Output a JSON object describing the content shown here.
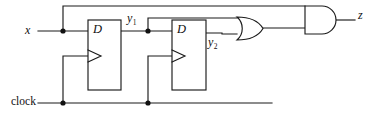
{
  "diagram": {
    "type": "logic-circuit-schematic",
    "background_color": "#ffffff",
    "line_color": "#1a1a1a"
  },
  "labels": {
    "input_x": "x",
    "input_clock": "clock",
    "signal_y1_base": "y",
    "signal_y1_sub": "1",
    "signal_y2_base": "y",
    "signal_y2_sub": "2",
    "output_z": "z",
    "flipflop1_d": "D",
    "flipflop2_d": "D"
  },
  "components": [
    {
      "id": "flipflop-1",
      "kind": "d-flip-flop",
      "label": "D",
      "inputs": [
        "x",
        "clock"
      ],
      "outputs": [
        "y1"
      ],
      "box": {
        "x": 88,
        "y": 20,
        "width": 33,
        "height": 70
      }
    },
    {
      "id": "flipflop-2",
      "kind": "d-flip-flop",
      "label": "D",
      "inputs": [
        "y1",
        "clock"
      ],
      "outputs": [
        "y2"
      ],
      "box": {
        "x": 172,
        "y": 20,
        "width": 34,
        "height": 70
      }
    },
    {
      "id": "or-gate-1",
      "kind": "or-gate",
      "inputs": [
        "y1",
        "y2"
      ],
      "outputs": [
        "or_out"
      ],
      "box": {
        "x": 237,
        "y": 17,
        "width": 26,
        "height": 23
      }
    },
    {
      "id": "and-gate-1",
      "kind": "and-gate",
      "inputs": [
        "x",
        "or_out"
      ],
      "outputs": [
        "z"
      ],
      "box": {
        "x": 305,
        "y": 6,
        "width": 31,
        "height": 28
      }
    }
  ],
  "nets": [
    {
      "id": "net-x",
      "from": "x",
      "to": [
        "flipflop-1.D",
        "and-gate-1.in1"
      ]
    },
    {
      "id": "net-clock",
      "from": "clock",
      "to": [
        "flipflop-1.clk",
        "flipflop-2.clk"
      ]
    },
    {
      "id": "net-y1",
      "from": "flipflop-1.Q",
      "to": [
        "flipflop-2.D",
        "or-gate-1.in1"
      ]
    },
    {
      "id": "net-y2",
      "from": "flipflop-2.Q",
      "to": [
        "or-gate-1.in2"
      ]
    },
    {
      "id": "net-or-out",
      "from": "or-gate-1.out",
      "to": [
        "and-gate-1.in2"
      ]
    },
    {
      "id": "net-z",
      "from": "and-gate-1.out",
      "to": [
        "z"
      ]
    }
  ],
  "junctions": [
    {
      "id": "junction-x",
      "x": 63,
      "y": 31
    },
    {
      "id": "junction-y1",
      "x": 148,
      "y": 31
    },
    {
      "id": "junction-clock-1",
      "x": 63,
      "y": 103
    },
    {
      "id": "junction-clock-2",
      "x": 148,
      "y": 103
    }
  ],
  "equations": {
    "z": "x · (y1 + y2)",
    "y1_next": "x",
    "y2_next": "y1"
  }
}
